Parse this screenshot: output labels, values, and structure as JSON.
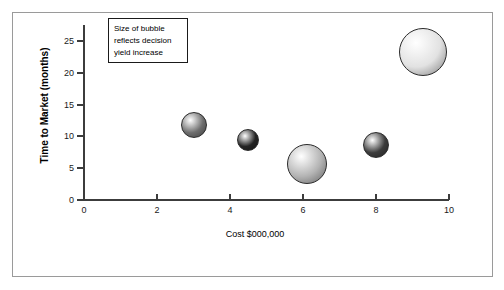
{
  "figure": {
    "frame_color": "#9a9a9a",
    "background": "#ffffff"
  },
  "legend": {
    "name": "bubble-size-note",
    "lines": [
      "Size of bubble",
      "reflects decision",
      "yield increase"
    ]
  },
  "chart_data": {
    "type": "scatter",
    "title": "",
    "subtitle": "",
    "xlabel": "Cost $000,000",
    "ylabel": "Time to Market (months)",
    "xlim": [
      0,
      10
    ],
    "ylim": [
      0,
      27.5
    ],
    "xticks": [
      0,
      2,
      4,
      6,
      8,
      10
    ],
    "xtick_labels": [
      "0",
      "2",
      "4",
      "6",
      "8",
      "10"
    ],
    "yticks": [
      0,
      5,
      10,
      15,
      20,
      25
    ],
    "ytick_labels": [
      "0",
      "5",
      "10",
      "15",
      "20",
      "25"
    ],
    "grid": false,
    "legend_position": "top-left",
    "annotations": [
      "Size of bubble reflects decision yield increase"
    ],
    "size_meaning": "Size of bubble reflects decision yield increase",
    "points": [
      {
        "label": "Option 1",
        "x": 3.0,
        "y": 11.8,
        "size": 26,
        "color": "#6e6e6e"
      },
      {
        "label": "Option 2",
        "x": 4.5,
        "y": 9.5,
        "size": 22,
        "color": "#242424"
      },
      {
        "label": "Option 3",
        "x": 6.1,
        "y": 5.7,
        "size": 40,
        "color": "#b4b4b4"
      },
      {
        "label": "Option 4",
        "x": 8.0,
        "y": 8.6,
        "size": 26,
        "color": "#3c3c3c"
      },
      {
        "label": "Option 5",
        "x": 9.3,
        "y": 23.3,
        "size": 48,
        "color": "#e2e2e2"
      }
    ]
  }
}
